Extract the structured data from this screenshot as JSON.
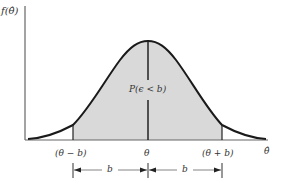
{
  "diagram": {
    "y_axis_label": "f(θ̂)",
    "x_axis_label": "θ̂",
    "area_label": "P(ϵ < b)",
    "ticks": {
      "left": "(θ − b)",
      "center": "θ",
      "right": "(θ + b)"
    },
    "interval_labels": {
      "left": "b",
      "right": "b"
    },
    "colors": {
      "curve": "#1a1a1a",
      "shaded": "#d9d9d9",
      "axis": "#555555"
    }
  }
}
